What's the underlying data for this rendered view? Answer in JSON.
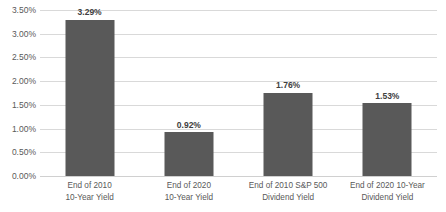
{
  "chart_data": {
    "type": "bar",
    "title": "",
    "xlabel": "",
    "ylabel": "",
    "categories": [
      "End of 2010 10-Year Yield",
      "End of 2020 10-Year Yield",
      "End of 2010 S&P 500 Dividend Yield",
      "End of 2020 10-Year Dividend Yield"
    ],
    "category_lines": [
      [
        "End of 2010",
        "10-Year Yield"
      ],
      [
        "End of 2020",
        "10-Year Yield"
      ],
      [
        "End of 2010 S&P 500",
        "Dividend Yield"
      ],
      [
        "End of 2020 10-Year",
        "Dividend Yield"
      ]
    ],
    "values": [
      3.29,
      0.92,
      1.76,
      1.53
    ],
    "value_labels": [
      "3.29%",
      "0.92%",
      "1.76%",
      "1.53%"
    ],
    "ylim": [
      0,
      3.5
    ],
    "ytick_values": [
      0,
      0.5,
      1.0,
      1.5,
      2.0,
      2.5,
      3.0,
      3.5
    ],
    "ytick_labels": [
      "0.00%",
      "0.50%",
      "1.00%",
      "1.50%",
      "2.00%",
      "2.50%",
      "3.00%",
      "3.50%"
    ],
    "grid": true,
    "legend": false,
    "bar_color": "#595959",
    "gridline_color": "#d9d9d9",
    "background_color": "#ffffff",
    "label_color": "#595959"
  }
}
